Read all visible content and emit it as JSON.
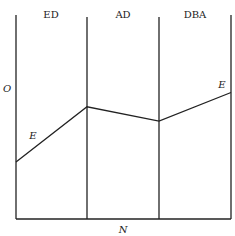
{
  "diagram": {
    "column_labels": [
      "ED",
      "AD",
      "DBA"
    ],
    "y_axis_label": "O",
    "x_axis_label": "N",
    "curve_labels": [
      "E",
      "E"
    ],
    "curve_relative_levels": {
      "description": "Height of curve E at each boundary (fraction of axis height, 0 = bottom, 1 = top)",
      "points": [
        0.28,
        0.55,
        0.48,
        0.62
      ]
    }
  }
}
